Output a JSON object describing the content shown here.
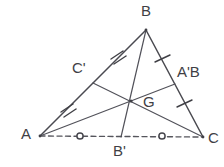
{
  "figure": {
    "kind": "geometry-diagram",
    "background_color": "#ffffff",
    "stroke_color": "#4a4a50",
    "label_color": "#3f3f45",
    "canvas": {
      "width": 224,
      "height": 167
    }
  },
  "vertices": [
    {
      "id": "B",
      "name": "vertex-b",
      "label": "B",
      "x": 146,
      "y": 30,
      "label_x": 141,
      "label_y": 5
    },
    {
      "id": "A",
      "name": "vertex-a",
      "label": "A",
      "x": 40,
      "y": 136,
      "label_x": 22,
      "label_y": 128
    },
    {
      "id": "C",
      "name": "vertex-c",
      "label": "C",
      "x": 203,
      "y": 137,
      "label_x": 208,
      "label_y": 132
    }
  ],
  "midpoints": [
    {
      "id": "Cp",
      "name": "midpoint-c-prime",
      "label": "C'",
      "x": 93,
      "y": 83,
      "label_x": 72,
      "label_y": 62,
      "on_side": "AB"
    },
    {
      "id": "Ap",
      "name": "midpoint-a-prime",
      "label": "A'B",
      "x": 175,
      "y": 84,
      "label_x": 178,
      "label_y": 66,
      "on_side": "BC"
    },
    {
      "id": "Bp",
      "name": "midpoint-b-prime",
      "label": "B'",
      "x": 121,
      "y": 137,
      "label_x": 113,
      "label_y": 145,
      "on_side": "AC"
    }
  ],
  "centroid": {
    "id": "G",
    "name": "centroid-g",
    "label": "G",
    "x": 131,
    "y": 101,
    "label_x": 144,
    "label_y": 95
  },
  "sides": [
    {
      "name": "side-ab",
      "from": "A",
      "to": "B",
      "style": "solid",
      "tick_marks": 2,
      "tick_glyph": "double-slash"
    },
    {
      "name": "side-bc",
      "from": "B",
      "to": "C",
      "style": "solid",
      "tick_marks": 1,
      "tick_glyph": "single-slash"
    },
    {
      "name": "side-ac",
      "from": "A",
      "to": "C",
      "style": "dashed",
      "tick_marks": 0,
      "tick_glyph": "circle"
    }
  ],
  "medians": [
    {
      "name": "median-a-to-aprime",
      "from": "A",
      "to": "Ap",
      "style": "solid"
    },
    {
      "name": "median-b-to-bprime",
      "from": "B",
      "to": "Bp",
      "style": "solid"
    },
    {
      "name": "median-c-to-cprime",
      "from": "C",
      "to": "Cp",
      "style": "solid"
    }
  ],
  "congruence_marks": {
    "ab_halves": {
      "count": 2,
      "glyph": "double-tick",
      "positions": [
        {
          "x": 68,
          "y": 110
        },
        {
          "x": 118,
          "y": 57
        }
      ]
    },
    "bc_halves": {
      "count": 1,
      "glyph": "single-tick",
      "positions": [
        {
          "x": 161,
          "y": 58
        },
        {
          "x": 189,
          "y": 110
        }
      ]
    },
    "ac_halves": {
      "count": 1,
      "glyph": "circle",
      "positions": [
        {
          "x": 80,
          "y": 136
        },
        {
          "x": 162,
          "y": 136
        }
      ]
    }
  },
  "labels": {
    "b": "B",
    "a": "A",
    "c": "C",
    "c_prime": "C'",
    "a_prime": "A'B",
    "b_prime": "B'",
    "g": "G"
  }
}
